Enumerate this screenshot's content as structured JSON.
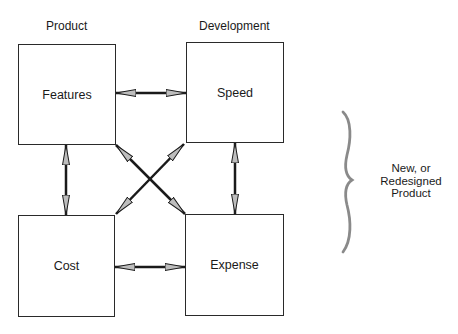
{
  "diagram": {
    "column_headers": [
      {
        "id": "product",
        "label": "Product"
      },
      {
        "id": "development",
        "label": "Development"
      }
    ],
    "nodes": [
      {
        "id": "features",
        "label": "Features",
        "column": "product",
        "row": "top"
      },
      {
        "id": "speed",
        "label": "Speed",
        "column": "development",
        "row": "top"
      },
      {
        "id": "cost",
        "label": "Cost",
        "column": "product",
        "row": "bottom"
      },
      {
        "id": "expense",
        "label": "Expense",
        "column": "development",
        "row": "bottom"
      }
    ],
    "edges": [
      {
        "from": "features",
        "to": "speed",
        "direction": "bidirectional"
      },
      {
        "from": "features",
        "to": "cost",
        "direction": "bidirectional"
      },
      {
        "from": "speed",
        "to": "expense",
        "direction": "bidirectional"
      },
      {
        "from": "cost",
        "to": "expense",
        "direction": "bidirectional"
      },
      {
        "from": "features",
        "to": "expense",
        "direction": "bidirectional"
      },
      {
        "from": "speed",
        "to": "cost",
        "direction": "bidirectional"
      }
    ],
    "brace": {
      "label_lines": [
        "New, or",
        "Redesigned",
        "Product"
      ]
    },
    "colors": {
      "line": "#1a1a1a",
      "arrowhead_fill": "#bdbdbd",
      "brace": "#8a8a8a",
      "background": "#ffffff"
    }
  }
}
